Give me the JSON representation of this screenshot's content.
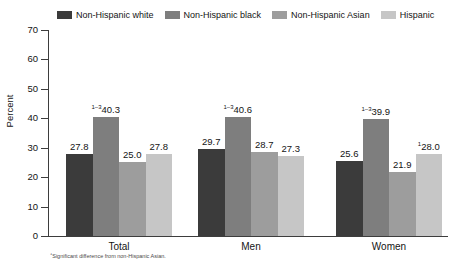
{
  "chart_data": {
    "type": "bar",
    "title": "",
    "subtitle": "",
    "xlabel": "",
    "ylabel": "Percent",
    "ylim": [
      0,
      70
    ],
    "yticks": [
      0,
      10,
      20,
      30,
      40,
      50,
      60,
      70
    ],
    "ytick_labels": [
      "0",
      "10",
      "20",
      "30",
      "40",
      "50",
      "60",
      "70"
    ],
    "grid": false,
    "legend_position": "top",
    "categories": [
      "Total",
      "Men",
      "Women"
    ],
    "series": [
      {
        "name": "Non-Hispanic white",
        "color": "#3b3b3b",
        "values": [
          27.8,
          29.7,
          25.6
        ],
        "labels": [
          "27.8",
          "29.7",
          "25.6"
        ],
        "markers": [
          "",
          "",
          ""
        ]
      },
      {
        "name": "Non-Hispanic black",
        "color": "#7e7e7e",
        "values": [
          40.3,
          40.6,
          39.9
        ],
        "labels": [
          "40.3",
          "40.6",
          "39.9"
        ],
        "markers": [
          "1–3",
          "1–3",
          "1–3"
        ]
      },
      {
        "name": "Non-Hispanic Asian",
        "color": "#9d9d9d",
        "values": [
          25.0,
          28.7,
          21.9
        ],
        "labels": [
          "25.0",
          "28.7",
          "21.9"
        ],
        "markers": [
          "",
          "",
          ""
        ]
      },
      {
        "name": "Hispanic",
        "color": "#c6c6c6",
        "values": [
          27.8,
          27.3,
          28.0
        ],
        "labels": [
          "27.8",
          "27.3",
          "28.0"
        ],
        "markers": [
          "",
          "",
          "1"
        ]
      }
    ]
  },
  "footnote": {
    "marker": "1",
    "text": "Significant difference from non-Hispanic Asian."
  }
}
